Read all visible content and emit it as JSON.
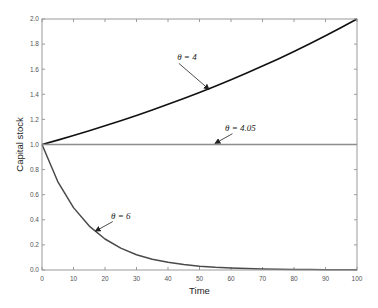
{
  "chart_data": {
    "type": "line",
    "title": "",
    "xlabel": "Time",
    "ylabel": "Capital stock",
    "xlim": [
      0,
      100
    ],
    "ylim": [
      0.0,
      2.0
    ],
    "grid": false,
    "x_ticks": [
      0,
      10,
      20,
      30,
      40,
      50,
      60,
      70,
      80,
      90,
      100
    ],
    "x_tick_labels": [
      "0",
      "10",
      "20",
      "30",
      "40",
      "50",
      "60",
      "70",
      "80",
      "90",
      "100"
    ],
    "y_ticks": [
      0.0,
      0.2,
      0.4,
      0.6,
      0.8,
      1.0,
      1.2,
      1.4,
      1.6,
      1.8,
      2.0
    ],
    "y_tick_labels": [
      "0.0",
      "0.2",
      "0.4",
      "0.6",
      "0.8",
      "1.0",
      "1.2",
      "1.4",
      "1.6",
      "1.8",
      "2.0"
    ],
    "x": [
      0,
      5,
      10,
      15,
      20,
      25,
      30,
      35,
      40,
      45,
      50,
      55,
      60,
      65,
      70,
      75,
      80,
      85,
      90,
      95,
      100
    ],
    "series": [
      {
        "name": "θ = 4",
        "color": "#111111",
        "values": [
          1.0,
          1.035,
          1.072,
          1.11,
          1.149,
          1.189,
          1.231,
          1.275,
          1.32,
          1.366,
          1.414,
          1.464,
          1.516,
          1.569,
          1.625,
          1.682,
          1.741,
          1.803,
          1.866,
          1.932,
          2.0
        ]
      },
      {
        "name": "θ = 4.05",
        "color": "#8c8c8c",
        "values": [
          1.0,
          1.0,
          1.0,
          1.0,
          1.0,
          1.0,
          1.0,
          1.0,
          1.0,
          1.0,
          1.0,
          1.0,
          1.0,
          1.0,
          1.0,
          1.0,
          1.0,
          1.0,
          1.0,
          1.0,
          1.0
        ]
      },
      {
        "name": "θ = 6",
        "color": "#4a4a4a",
        "values": [
          1.0,
          0.705,
          0.497,
          0.35,
          0.247,
          0.174,
          0.122,
          0.086,
          0.061,
          0.043,
          0.03,
          0.021,
          0.015,
          0.011,
          0.007,
          0.005,
          0.004,
          0.003,
          0.002,
          0.001,
          0.001
        ]
      }
    ],
    "annotations": [
      {
        "text": "θ = 4",
        "series": 0,
        "label_at": [
          46,
          1.67
        ],
        "arrow_to": [
          53,
          1.44
        ]
      },
      {
        "text": "θ = 4.05",
        "series": 1,
        "label_at": [
          63,
          1.11
        ],
        "arrow_to": [
          55,
          1.01
        ]
      },
      {
        "text": "θ = 6",
        "series": 2,
        "label_at": [
          25,
          0.41
        ],
        "arrow_to": [
          17,
          0.31
        ]
      }
    ]
  }
}
